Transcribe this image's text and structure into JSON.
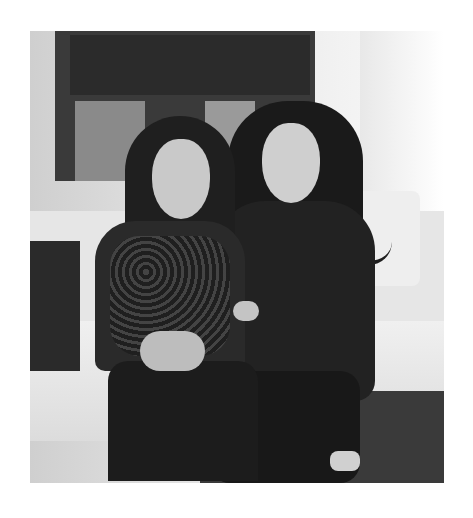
{
  "image": {
    "description": "Grayscale photo of two women with long dark hair sitting together on a white sofa in front of a window",
    "subjects": [
      {
        "position": "left",
        "clothing": "dark patterned long-sleeve top, dark trousers"
      },
      {
        "position": "right",
        "clothing": "black top, black trousers"
      }
    ],
    "colors": {
      "background": "#ffffff",
      "dark": "#1f1f1f",
      "light": "#e6e6e6"
    }
  }
}
